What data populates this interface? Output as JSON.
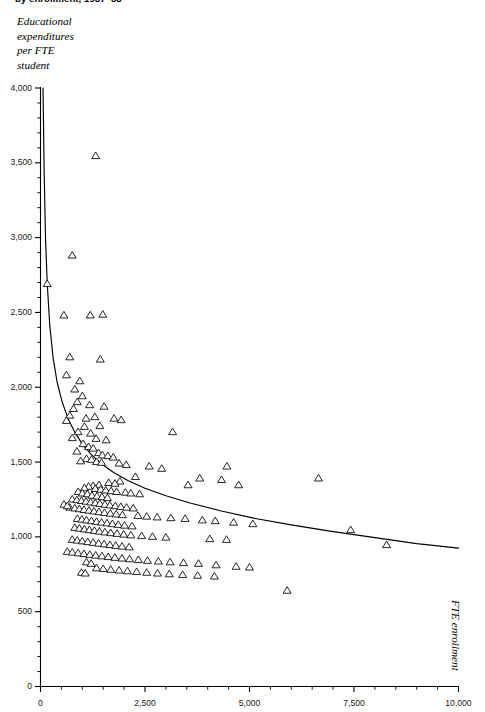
{
  "title": "by enrollment, 1987–88",
  "y_caption_lines": [
    "Educational",
    "expenditures",
    "per FTE",
    "student"
  ],
  "x_caption": "FTE enrollment",
  "colors": {
    "axis": "#000000",
    "marker_stroke": "#000000",
    "marker_fill": "#ffffff",
    "curve": "#000000",
    "background": "#ffffff",
    "tick_text": "#1a1a1a"
  },
  "axes": {
    "y_ticks_major": [
      "0",
      "500",
      "1,000",
      "1,500",
      "2,000",
      "2,500",
      "3,000",
      "3,500",
      "4,000"
    ],
    "x_ticks_major": [
      "0",
      "2,500",
      "5,000",
      "7,500",
      "10,000"
    ]
  },
  "chart_data": {
    "type": "scatter",
    "title": "by enrollment, 1987–88",
    "xlabel": "FTE enrollment",
    "ylabel": "Educational expenditures per FTE student",
    "xlim": [
      0,
      10000
    ],
    "ylim": [
      0,
      4000
    ],
    "xticks": [
      0,
      2500,
      5000,
      7500,
      10000
    ],
    "yticks": [
      0,
      500,
      1000,
      1500,
      2000,
      2500,
      3000,
      3500,
      4000
    ],
    "x_minor_tick_step": 500,
    "y_minor_tick_step": 100,
    "grid": false,
    "legend": null,
    "marker": "open-triangle",
    "series": [
      {
        "name": "Institutions",
        "points": [
          [
            160,
            2690
          ],
          [
            1320,
            3545
          ],
          [
            760,
            2880
          ],
          [
            560,
            2480
          ],
          [
            1190,
            2480
          ],
          [
            1490,
            2485
          ],
          [
            700,
            2200
          ],
          [
            1430,
            2185
          ],
          [
            620,
            2080
          ],
          [
            940,
            2040
          ],
          [
            820,
            1985
          ],
          [
            1000,
            1940
          ],
          [
            880,
            1900
          ],
          [
            1175,
            1880
          ],
          [
            1520,
            1870
          ],
          [
            790,
            1855
          ],
          [
            700,
            1810
          ],
          [
            620,
            1775
          ],
          [
            1090,
            1790
          ],
          [
            1300,
            1800
          ],
          [
            1760,
            1790
          ],
          [
            1930,
            1780
          ],
          [
            3160,
            1700
          ],
          [
            1420,
            1740
          ],
          [
            1050,
            1735
          ],
          [
            900,
            1700
          ],
          [
            1200,
            1690
          ],
          [
            760,
            1660
          ],
          [
            1330,
            1655
          ],
          [
            1570,
            1645
          ],
          [
            1020,
            1620
          ],
          [
            1150,
            1600
          ],
          [
            1260,
            1590
          ],
          [
            870,
            1570
          ],
          [
            1390,
            1560
          ],
          [
            1480,
            1545
          ],
          [
            1610,
            1540
          ],
          [
            1740,
            1530
          ],
          [
            1100,
            1520
          ],
          [
            1220,
            1515
          ],
          [
            960,
            1505
          ],
          [
            1340,
            1500
          ],
          [
            1460,
            1495
          ],
          [
            1880,
            1490
          ],
          [
            2050,
            1480
          ],
          [
            2600,
            1470
          ],
          [
            2900,
            1455
          ],
          [
            4460,
            1470
          ],
          [
            4330,
            1380
          ],
          [
            3810,
            1390
          ],
          [
            6650,
            1390
          ],
          [
            4740,
            1345
          ],
          [
            3530,
            1345
          ],
          [
            2270,
            1400
          ],
          [
            1900,
            1370
          ],
          [
            1630,
            1360
          ],
          [
            1780,
            1355
          ],
          [
            1400,
            1345
          ],
          [
            1260,
            1340
          ],
          [
            1150,
            1335
          ],
          [
            1050,
            1325
          ],
          [
            1310,
            1320
          ],
          [
            1440,
            1315
          ],
          [
            1560,
            1310
          ],
          [
            1690,
            1305
          ],
          [
            1820,
            1300
          ],
          [
            2030,
            1295
          ],
          [
            2160,
            1290
          ],
          [
            2370,
            1285
          ],
          [
            900,
            1300
          ],
          [
            1000,
            1290
          ],
          [
            1120,
            1285
          ],
          [
            1230,
            1275
          ],
          [
            1350,
            1270
          ],
          [
            1470,
            1265
          ],
          [
            1600,
            1260
          ],
          [
            760,
            1250
          ],
          [
            870,
            1245
          ],
          [
            980,
            1240
          ],
          [
            1090,
            1235
          ],
          [
            1200,
            1230
          ],
          [
            1310,
            1225
          ],
          [
            1420,
            1220
          ],
          [
            1540,
            1215
          ],
          [
            1660,
            1210
          ],
          [
            1790,
            1205
          ],
          [
            1920,
            1200
          ],
          [
            2060,
            1195
          ],
          [
            2220,
            1190
          ],
          [
            700,
            1195
          ],
          [
            560,
            1215
          ],
          [
            640,
            1205
          ],
          [
            820,
            1190
          ],
          [
            930,
            1185
          ],
          [
            1040,
            1180
          ],
          [
            1160,
            1175
          ],
          [
            1280,
            1170
          ],
          [
            1400,
            1165
          ],
          [
            1530,
            1160
          ],
          [
            1670,
            1155
          ],
          [
            1810,
            1150
          ],
          [
            1960,
            1145
          ],
          [
            2330,
            1140
          ],
          [
            2540,
            1135
          ],
          [
            2790,
            1130
          ],
          [
            3120,
            1125
          ],
          [
            3460,
            1120
          ],
          [
            3870,
            1110
          ],
          [
            4180,
            1105
          ],
          [
            4620,
            1095
          ],
          [
            5080,
            1085
          ],
          [
            7420,
            1045
          ],
          [
            880,
            1120
          ],
          [
            990,
            1115
          ],
          [
            1100,
            1110
          ],
          [
            1220,
            1105
          ],
          [
            1340,
            1100
          ],
          [
            1460,
            1095
          ],
          [
            1590,
            1090
          ],
          [
            1720,
            1085
          ],
          [
            1860,
            1080
          ],
          [
            2010,
            1075
          ],
          [
            2190,
            1070
          ],
          [
            820,
            1060
          ],
          [
            930,
            1055
          ],
          [
            1050,
            1050
          ],
          [
            1170,
            1045
          ],
          [
            1290,
            1040
          ],
          [
            1410,
            1035
          ],
          [
            1540,
            1030
          ],
          [
            1680,
            1025
          ],
          [
            1830,
            1020
          ],
          [
            1990,
            1015
          ],
          [
            2160,
            1010
          ],
          [
            2420,
            1005
          ],
          [
            2680,
            1000
          ],
          [
            3000,
            995
          ],
          [
            4050,
            985
          ],
          [
            4450,
            980
          ],
          [
            8280,
            945
          ],
          [
            760,
            980
          ],
          [
            880,
            975
          ],
          [
            1000,
            970
          ],
          [
            1130,
            965
          ],
          [
            1260,
            960
          ],
          [
            1390,
            955
          ],
          [
            1520,
            950
          ],
          [
            1660,
            945
          ],
          [
            1800,
            940
          ],
          [
            1950,
            935
          ],
          [
            2120,
            930
          ],
          [
            640,
            900
          ],
          [
            760,
            895
          ],
          [
            900,
            890
          ],
          [
            1040,
            885
          ],
          [
            1180,
            880
          ],
          [
            1320,
            875
          ],
          [
            1470,
            870
          ],
          [
            1620,
            865
          ],
          [
            1780,
            860
          ],
          [
            1950,
            855
          ],
          [
            2130,
            850
          ],
          [
            2340,
            845
          ],
          [
            2560,
            840
          ],
          [
            2820,
            835
          ],
          [
            3100,
            830
          ],
          [
            3420,
            825
          ],
          [
            3780,
            820
          ],
          [
            4200,
            810
          ],
          [
            4680,
            800
          ],
          [
            5000,
            795
          ],
          [
            5900,
            640
          ],
          [
            1340,
            790
          ],
          [
            1500,
            785
          ],
          [
            1680,
            780
          ],
          [
            1880,
            775
          ],
          [
            2080,
            770
          ],
          [
            2300,
            765
          ],
          [
            2540,
            760
          ],
          [
            2800,
            755
          ],
          [
            3080,
            750
          ],
          [
            3400,
            745
          ],
          [
            3760,
            740
          ],
          [
            4160,
            735
          ],
          [
            1100,
            830
          ],
          [
            1210,
            820
          ],
          [
            980,
            760
          ],
          [
            1070,
            755
          ]
        ]
      }
    ],
    "fit_curve": {
      "description": "Decreasing power/log fit line overlaid on the scatter",
      "points": [
        [
          60,
          4000
        ],
        [
          90,
          3400
        ],
        [
          120,
          3000
        ],
        [
          160,
          2700
        ],
        [
          220,
          2420
        ],
        [
          300,
          2200
        ],
        [
          400,
          2030
        ],
        [
          520,
          1900
        ],
        [
          660,
          1790
        ],
        [
          820,
          1700
        ],
        [
          1000,
          1620
        ],
        [
          1200,
          1555
        ],
        [
          1450,
          1490
        ],
        [
          1750,
          1430
        ],
        [
          2100,
          1375
        ],
        [
          2500,
          1325
        ],
        [
          3000,
          1275
        ],
        [
          3600,
          1225
        ],
        [
          4300,
          1175
        ],
        [
          5100,
          1125
        ],
        [
          6000,
          1080
        ],
        [
          7000,
          1035
        ],
        [
          8000,
          995
        ],
        [
          9000,
          955
        ],
        [
          10000,
          925
        ]
      ]
    }
  }
}
